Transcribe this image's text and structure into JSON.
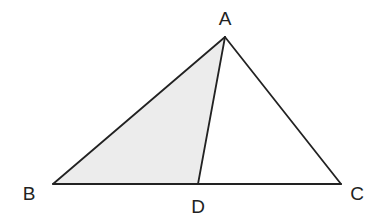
{
  "diagram": {
    "type": "triangle",
    "colors": {
      "background": "#ffffff",
      "stroke": "#222222",
      "shade": "#ececec"
    },
    "points": {
      "A": {
        "label": "A",
        "x": 225,
        "y": 37,
        "label_x": 225,
        "label_y": 18
      },
      "B": {
        "label": "B",
        "x": 53,
        "y": 184,
        "label_x": 29,
        "label_y": 193
      },
      "C": {
        "label": "C",
        "x": 341,
        "y": 184,
        "label_x": 357,
        "label_y": 193
      },
      "D": {
        "label": "D",
        "x": 198,
        "y": 184,
        "label_x": 198,
        "label_y": 206
      }
    },
    "segments": [
      "AB",
      "AC",
      "BC",
      "AD"
    ],
    "shaded_region": "ABD"
  }
}
